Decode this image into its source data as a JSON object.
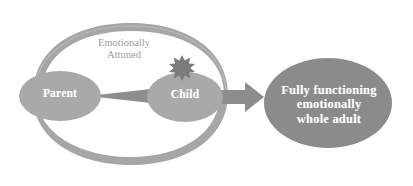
{
  "diagram": {
    "background_color": "#ffffff",
    "nodes": [
      {
        "id": "parent",
        "label": "Parent",
        "shape": "ellipse",
        "fill": "#a9a9a9",
        "text_color": "#ffffff"
      },
      {
        "id": "child",
        "label": "Child",
        "shape": "ellipse",
        "fill": "#a9a9a9",
        "text_color": "#ffffff"
      },
      {
        "id": "adult",
        "label": "Fully functioning\nemotionally\nwhole adult",
        "shape": "ellipse",
        "fill": "#8b8b8b",
        "text_color": "#ffffff"
      }
    ],
    "annotations": [
      {
        "id": "attuned",
        "text": "Emotionally\nAttuned",
        "color": "#9d9d9d"
      }
    ],
    "decorations": [
      {
        "id": "feedback-ring",
        "type": "ellipse-ring",
        "color": "#9e9e9e",
        "description": "tapered ring encircling parent and child"
      },
      {
        "id": "burst",
        "type": "starburst",
        "color": "#7a7a7a",
        "description": "spiky burst on top-left of child"
      }
    ],
    "arrows": [
      {
        "id": "parent-to-child",
        "from": "parent",
        "to": "child",
        "color": "#8d8d8d",
        "style": "tapered"
      },
      {
        "id": "child-to-adult",
        "from": "child",
        "to": "adult",
        "color": "#8d8d8d",
        "style": "block"
      }
    ]
  }
}
